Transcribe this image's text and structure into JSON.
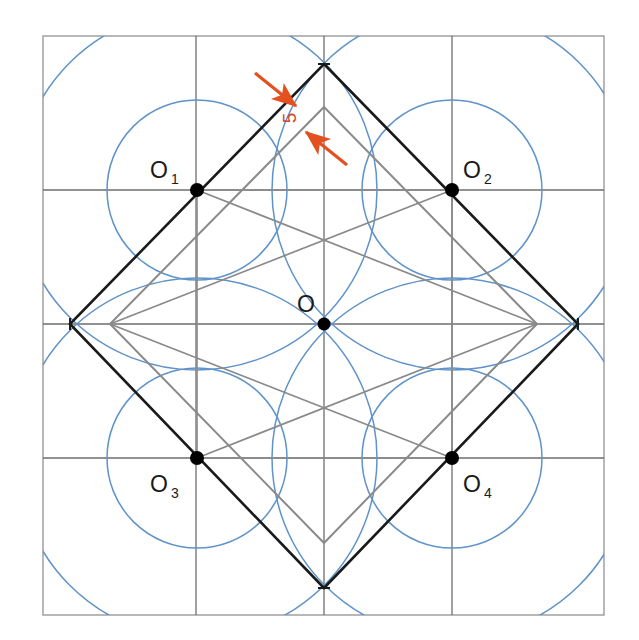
{
  "figure": {
    "labels": {
      "center": {
        "name": "O",
        "sub": "",
        "x": 324,
        "y": 324,
        "text_x": 306,
        "text_y": 312
      },
      "o1": {
        "name": "O",
        "sub": "1",
        "x": 197,
        "y": 190,
        "text_x": 159,
        "text_y": 178
      },
      "o2": {
        "name": "O",
        "sub": "2",
        "x": 452,
        "y": 190,
        "text_x": 462,
        "text_y": 178
      },
      "o3": {
        "name": "O",
        "sub": "3",
        "x": 197,
        "y": 458,
        "text_x": 159,
        "text_y": 492
      },
      "o4": {
        "name": "O",
        "sub": "4",
        "x": 452,
        "y": 458,
        "text_x": 462,
        "text_y": 492
      }
    },
    "dimension": {
      "value": "5",
      "text_x": 296,
      "text_y": 118,
      "rotation": -90,
      "arrow1": {
        "x1": 258,
        "y1": 78,
        "x2": 292,
        "y2": 104
      },
      "arrow2": {
        "x1": 342,
        "y1": 160,
        "x2": 310,
        "y2": 134
      }
    },
    "colors": {
      "frame": "#8c8c8c",
      "grid": "#6e6e6e",
      "circle": "#5f93c9",
      "diamond_black": "#1a1a1a",
      "diamond_gray": "#8a8a8a",
      "dimension": "#e2511f",
      "dot": "#000000"
    },
    "grid": {
      "frame": {
        "x": 43,
        "y": 36,
        "w": 561,
        "h": 579
      },
      "vertical_lines": [
        196,
        324,
        452
      ],
      "horizontal_lines": [
        190,
        324,
        458
      ]
    },
    "circles": [
      {
        "cx": 197,
        "cy": 190,
        "r": 90,
        "name": "small-circle-o1"
      },
      {
        "cx": 452,
        "cy": 190,
        "r": 90,
        "name": "small-circle-o2"
      },
      {
        "cx": 197,
        "cy": 458,
        "r": 90,
        "name": "small-circle-o3"
      },
      {
        "cx": 452,
        "cy": 458,
        "r": 90,
        "name": "small-circle-o4"
      },
      {
        "cx": 197,
        "cy": 190,
        "r": 180,
        "name": "large-circle-o1"
      },
      {
        "cx": 452,
        "cy": 190,
        "r": 180,
        "name": "large-circle-o2"
      },
      {
        "cx": 197,
        "cy": 458,
        "r": 180,
        "name": "large-circle-o3"
      },
      {
        "cx": 452,
        "cy": 458,
        "r": 180,
        "name": "large-circle-o4"
      }
    ],
    "black_diamond": {
      "points": "324,64 578,324 324,588 70,324",
      "name": "outer-rotated-square"
    },
    "gray_diamond": {
      "points": "324,107 537,324 324,543 110,324",
      "name": "inner-rotated-square"
    },
    "gray_square": {
      "points": "197,190 452,190 452,458 197,458",
      "name": "inner-axis-square"
    },
    "gray_diagonals": [
      {
        "x1": 110,
        "y1": 324,
        "x2": 324,
        "y2": 107,
        "name": "gray-diag-tl"
      },
      {
        "x1": 324,
        "y1": 107,
        "x2": 537,
        "y2": 324,
        "name": "gray-diag-tr"
      },
      {
        "x1": 537,
        "y1": 324,
        "x2": 324,
        "y2": 543,
        "name": "gray-diag-br"
      },
      {
        "x1": 324,
        "y1": 543,
        "x2": 110,
        "y2": 324,
        "name": "gray-diag-bl"
      }
    ],
    "dots": [
      {
        "cx": 324,
        "cy": 324,
        "r": 6,
        "name": "dot-center-o"
      },
      {
        "cx": 197,
        "cy": 190,
        "r": 7,
        "name": "dot-o1"
      },
      {
        "cx": 452,
        "cy": 190,
        "r": 7,
        "name": "dot-o2"
      },
      {
        "cx": 197,
        "cy": 458,
        "r": 7,
        "name": "dot-o3"
      },
      {
        "cx": 452,
        "cy": 458,
        "r": 7,
        "name": "dot-o4"
      }
    ],
    "vertex_ticks": [
      {
        "x": 324,
        "y": 64,
        "name": "tick-top"
      },
      {
        "x": 578,
        "y": 324,
        "name": "tick-right"
      },
      {
        "x": 324,
        "y": 588,
        "name": "tick-bottom"
      },
      {
        "x": 70,
        "y": 324,
        "name": "tick-left"
      }
    ]
  }
}
